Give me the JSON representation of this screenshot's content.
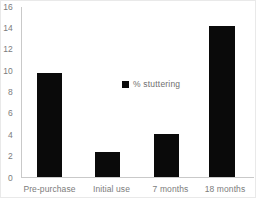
{
  "chart_data": {
    "type": "bar",
    "title": "",
    "xlabel": "",
    "ylabel": "",
    "categories": [
      "Pre-purchase",
      "Initial use",
      "7 months",
      "18 months"
    ],
    "values": [
      9.7,
      2.3,
      4.0,
      14.1
    ],
    "series": [
      {
        "name": "% stuttering",
        "values": [
          9.7,
          2.3,
          4.0,
          14.1
        ],
        "color": "#0a0a0a"
      }
    ],
    "ylim": [
      0,
      16
    ],
    "yticks": [
      0,
      2,
      4,
      6,
      8,
      10,
      12,
      14,
      16
    ],
    "ytick_labels": [
      "0",
      "2",
      "4",
      "6",
      "8",
      "10",
      "12",
      "14",
      "16"
    ],
    "grid": false,
    "legend": {
      "position": "inside-upper-center",
      "entries": [
        {
          "label": "% stuttering",
          "marker": "square-marker",
          "color": "#0a0a0a"
        }
      ]
    },
    "axis_color": "#c9c9c9",
    "tick_label_color": "#7c7c7c",
    "background": "#ffffff"
  }
}
